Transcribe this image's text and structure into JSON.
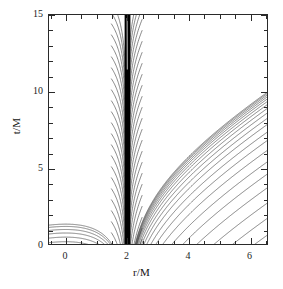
{
  "figure": {
    "background": "#ffffff",
    "frame_color": "#2a2a2a",
    "curve_color": "#3a3a3a"
  },
  "chart_data": {
    "type": "line",
    "title": "",
    "subtitle": "",
    "xlabel": "r/M",
    "ylabel": "t/M",
    "xlim": [
      -0.55,
      6.6
    ],
    "ylim": [
      0,
      15
    ],
    "grid": false,
    "legend": null,
    "annotations": [
      {
        "text": "horizon accumulation band",
        "kind": "dense-black-vertical-band",
        "x": 2.0,
        "x_extent": [
          1.93,
          2.12
        ]
      }
    ],
    "xticks_major": [
      0,
      2,
      4,
      6
    ],
    "xticks_major_labels": [
      "0",
      "2",
      "4",
      "6"
    ],
    "xticks_minor": [
      -0.5,
      0.5,
      1,
      1.5,
      2.5,
      3,
      3.5,
      4.5,
      5,
      5.5,
      6.5
    ],
    "yticks_major": [
      0,
      5,
      10,
      15
    ],
    "yticks_major_labels": [
      "0",
      "5",
      "10",
      "15"
    ],
    "yticks_minor": [
      1,
      2,
      3,
      4,
      6,
      7,
      8,
      9,
      11,
      12,
      13,
      14
    ],
    "horizon_r": 2.0,
    "series": [
      {
        "name": "interior-geodesic",
        "region": "r<2M",
        "r_start": 1.98,
        "count": 22,
        "t_offsets": [
          -14.5,
          -13.3,
          -12.1,
          -10.9,
          -9.7,
          -8.5,
          -7.4,
          -6.3,
          -5.3,
          -4.3,
          -3.4,
          -2.6,
          -1.85,
          -1.2,
          -0.65,
          -0.2,
          0.15,
          0.45,
          0.72,
          0.95,
          1.15,
          1.3
        ]
      },
      {
        "name": "exterior-geodesic",
        "region": "r>2M",
        "r_start": 2.02,
        "count": 26,
        "t_offsets": [
          -14.8,
          -13.6,
          -12.4,
          -11.2,
          -10.0,
          -8.8,
          -7.7,
          -6.6,
          -5.6,
          -4.6,
          -3.7,
          -2.9,
          -2.15,
          -1.5,
          -0.95,
          -0.45,
          -0.05,
          0.3,
          0.6,
          0.85,
          1.05,
          1.22,
          1.36,
          1.48,
          1.58,
          1.66
        ]
      }
    ]
  }
}
